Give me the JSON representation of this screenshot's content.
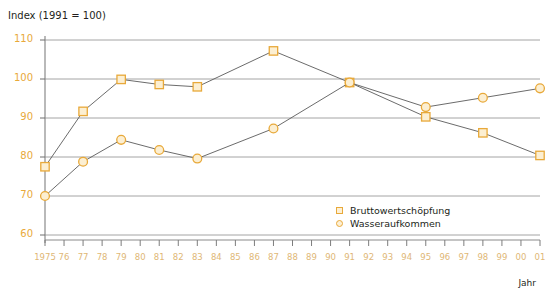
{
  "chart_data": {
    "type": "line",
    "title": "Index (1991 = 100)",
    "xlabel": "Jahr",
    "ylabel": "",
    "ylim": [
      60,
      110
    ],
    "yticks": [
      60,
      70,
      80,
      90,
      100,
      110
    ],
    "grid": true,
    "legend_position": "bottom-right",
    "x": [
      1975,
      1976,
      1977,
      1978,
      1979,
      1980,
      1981,
      1982,
      1983,
      1984,
      1985,
      1986,
      1987,
      1988,
      1989,
      1990,
      1991,
      1992,
      1993,
      1994,
      1995,
      1996,
      1997,
      1998,
      1999,
      2000,
      2001
    ],
    "xtick_labels": [
      "1975",
      "76",
      "77",
      "78",
      "79",
      "80",
      "81",
      "82",
      "83",
      "84",
      "85",
      "86",
      "87",
      "88",
      "89",
      "90",
      "91",
      "92",
      "93",
      "94",
      "95",
      "96",
      "97",
      "98",
      "99",
      "00",
      "01"
    ],
    "series": [
      {
        "name": "Bruttowertschöpfung",
        "marker": "square",
        "color": "#e8a93a",
        "marker_fill": "#fcefd2",
        "line_color": "#5a5a5a",
        "points": [
          {
            "x": 1975,
            "y": 77.5
          },
          {
            "x": 1977,
            "y": 91.7
          },
          {
            "x": 1979,
            "y": 99.9
          },
          {
            "x": 1981,
            "y": 98.6
          },
          {
            "x": 1983,
            "y": 98.0
          },
          {
            "x": 1987,
            "y": 107.2
          },
          {
            "x": 1991,
            "y": 99.1
          },
          {
            "x": 1995,
            "y": 90.3
          },
          {
            "x": 1998,
            "y": 86.2
          },
          {
            "x": 2001,
            "y": 80.4
          }
        ]
      },
      {
        "name": "Wasseraufkommen",
        "marker": "circle",
        "color": "#e8a93a",
        "marker_fill": "#fcefd2",
        "line_color": "#5a5a5a",
        "points": [
          {
            "x": 1975,
            "y": 70.0
          },
          {
            "x": 1977,
            "y": 78.8
          },
          {
            "x": 1979,
            "y": 84.4
          },
          {
            "x": 1981,
            "y": 81.8
          },
          {
            "x": 1983,
            "y": 79.6
          },
          {
            "x": 1987,
            "y": 87.3
          },
          {
            "x": 1991,
            "y": 99.1
          },
          {
            "x": 1995,
            "y": 92.8
          },
          {
            "x": 1998,
            "y": 95.2
          },
          {
            "x": 2001,
            "y": 97.6
          }
        ]
      }
    ]
  },
  "legend": {
    "items": [
      {
        "label": "Bruttowertschöpfung",
        "marker": "square"
      },
      {
        "label": "Wasseraufkommen",
        "marker": "circle"
      }
    ]
  }
}
